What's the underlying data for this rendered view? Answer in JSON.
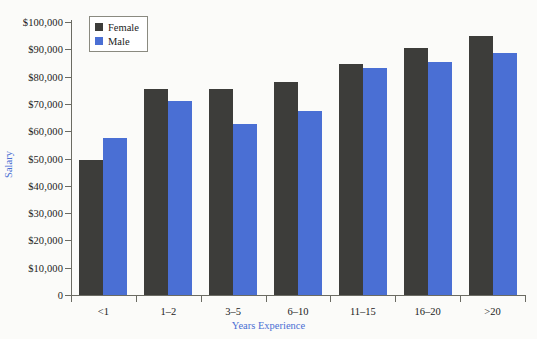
{
  "chart_data": {
    "type": "bar",
    "title": "",
    "subtitle": "",
    "xlabel": "Years Experience",
    "ylabel": "Salary",
    "categories": [
      "<1",
      "1–2",
      "3–5",
      "6–10",
      "11–15",
      "16–20",
      ">20"
    ],
    "series": [
      {
        "name": "Female",
        "color": "#3d3d3a",
        "values": [
          49500,
          75500,
          75500,
          78000,
          84500,
          90500,
          95000
        ]
      },
      {
        "name": "Male",
        "color": "#4a6fd4",
        "values": [
          57500,
          71000,
          62500,
          67500,
          83000,
          85500,
          88500
        ]
      }
    ],
    "ylim": [
      0,
      100000
    ],
    "y_ticks": [
      0,
      10000,
      20000,
      30000,
      40000,
      50000,
      60000,
      70000,
      80000,
      90000,
      100000
    ],
    "y_tick_labels": [
      "0",
      "$10,000",
      "$20,000",
      "$30,000",
      "$40,000",
      "$50,000",
      "$60,000",
      "$70,000",
      "$80,000",
      "$90,000",
      "$100,000"
    ],
    "grid": false,
    "legend_position": "top-left",
    "legend_entries": [
      "Female",
      "Male"
    ]
  },
  "axis_title_color": "#4a6fd4",
  "axis_line_color": "#6b6b63",
  "background_color": "#fbfbf9"
}
